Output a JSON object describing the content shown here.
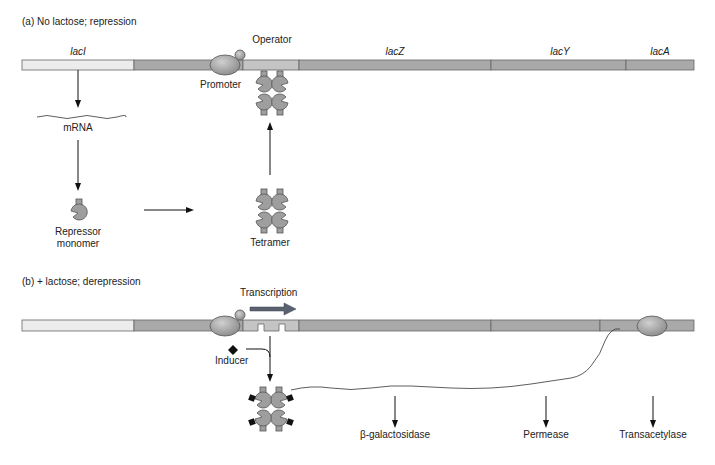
{
  "panel_a": {
    "title": "(a) No lactose; repression",
    "genes": {
      "lacI": "lacI",
      "lacZ": "lacZ",
      "lacY": "lacY",
      "lacA": "lacA"
    },
    "operator_label": "Operator",
    "promoter_label": "Promoter",
    "mrna_label": "mRNA",
    "repressor_label_line1": "Repressor",
    "repressor_label_line2": "monomer",
    "tetramer_label": "Tetramer"
  },
  "panel_b": {
    "title": "(b) + lactose; derepression",
    "transcription_label": "Transcription",
    "inducer_label": "Inducer",
    "products": [
      "β-galactosidase",
      "Permease",
      "Transacetylase"
    ]
  },
  "colors": {
    "lacI_fill": "#ececec",
    "gene_fill": "#a9a9a9",
    "operator_fill": "#c4c4c4",
    "protein_fill": "#9e9e9e",
    "transcription_arrow": "#5a6270"
  }
}
